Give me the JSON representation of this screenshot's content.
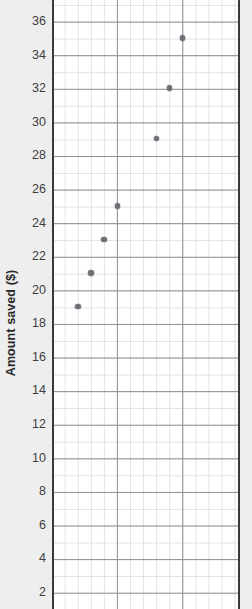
{
  "chart_data": {
    "type": "scatter",
    "title": "",
    "xlabel": "",
    "ylabel": "Amount saved ($)",
    "x": [
      2,
      3,
      4,
      5,
      8,
      9,
      10
    ],
    "values": [
      19,
      21,
      23,
      25,
      29,
      32,
      35
    ],
    "points": [
      {
        "x": 2,
        "y": 19
      },
      {
        "x": 3,
        "y": 21
      },
      {
        "x": 4,
        "y": 23
      },
      {
        "x": 5,
        "y": 25
      },
      {
        "x": 8,
        "y": 29
      },
      {
        "x": 9,
        "y": 32
      },
      {
        "x": 10,
        "y": 35
      }
    ],
    "ylim": [
      1,
      37
    ],
    "xlim": [
      0,
      14
    ],
    "ytick_labels": [
      "36",
      "34",
      "32",
      "30",
      "28",
      "26",
      "24",
      "22",
      "20",
      "18",
      "16",
      "14",
      "12",
      "10",
      "8",
      "6",
      "4",
      "2"
    ],
    "ytick_values": [
      36,
      34,
      32,
      30,
      28,
      26,
      24,
      22,
      20,
      18,
      16,
      14,
      12,
      10,
      8,
      6,
      4,
      2
    ],
    "xtick_labels": [],
    "grid": true,
    "grid_minor": true,
    "legend": null,
    "legend_position": "none",
    "colors": {
      "point": "#6e6e74",
      "grid_major": "#8d8d96",
      "grid_minor": "#e2e2e6",
      "axis_spine": "#3a3a3a",
      "plot_background": "#ffffff",
      "figure_background": "#eeeeee",
      "tick_label": "#3d3d3d",
      "axis_title": "#2a2a2a"
    }
  }
}
